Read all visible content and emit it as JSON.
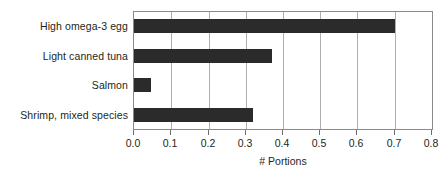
{
  "chart_data": {
    "type": "bar",
    "orientation": "horizontal",
    "title": "",
    "xlabel": "# Portions",
    "ylabel": "",
    "categories": [
      "High omega-3 egg",
      "Light canned tuna",
      "Salmon",
      "Shrimp, mixed species"
    ],
    "values": [
      0.7,
      0.37,
      0.045,
      0.32
    ],
    "xlim": [
      0.0,
      0.8
    ],
    "xticks": [
      0.0,
      0.1,
      0.2,
      0.3,
      0.4,
      0.5,
      0.6,
      0.7,
      0.8
    ],
    "xtick_labels": [
      "0.0",
      "0.1",
      "0.2",
      "0.3",
      "0.4",
      "0.5",
      "0.6",
      "0.7",
      "0.8"
    ],
    "grid": "vertical",
    "legend": "none",
    "bar_color": "#2b2b2b",
    "frame_color": "#8a8a8a",
    "grid_color": "#b0b0b0"
  }
}
